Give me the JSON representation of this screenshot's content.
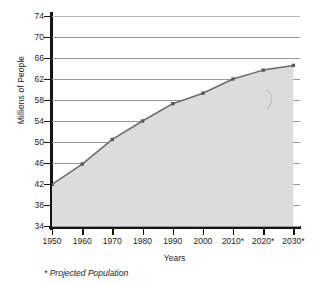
{
  "chart_data": {
    "type": "area",
    "title": "",
    "xlabel": "Years",
    "ylabel": "Millions of People",
    "categories": [
      "1950",
      "1960",
      "1970",
      "1980",
      "1990",
      "2000",
      "2010*",
      "2020*",
      "2030*"
    ],
    "x": [
      1950,
      1960,
      1970,
      1980,
      1990,
      2000,
      2010,
      2020,
      2030
    ],
    "values": [
      41.9,
      45.8,
      50.5,
      54.0,
      57.3,
      59.3,
      62.0,
      63.7,
      64.6
    ],
    "series": [
      {
        "name": "Population",
        "values": [
          41.9,
          45.8,
          50.5,
          54.0,
          57.3,
          59.3,
          62.0,
          63.7,
          64.6
        ]
      }
    ],
    "ylim": [
      34,
      74
    ],
    "yticks": [
      34,
      38,
      42,
      46,
      50,
      54,
      58,
      62,
      66,
      70,
      74
    ],
    "ytick_labels": [
      "34",
      "38",
      "42",
      "46",
      "50",
      "54",
      "58",
      "62",
      "66",
      "70",
      "74"
    ],
    "xtick_labels": [
      "1950",
      "1960",
      "1970",
      "1980",
      "1990",
      "2000",
      "2010*",
      "2020*",
      "2030*"
    ],
    "grid": true,
    "legend": "none",
    "footnote": "* Projected Population",
    "colors": {
      "area_fill": "#dcdcdc",
      "line": "#6b6b6b",
      "marker": "#5a5a5a",
      "gridline": "#9a9a9a",
      "axis": "#141414",
      "text": "#1d1d1d",
      "background": "#ffffff"
    }
  }
}
